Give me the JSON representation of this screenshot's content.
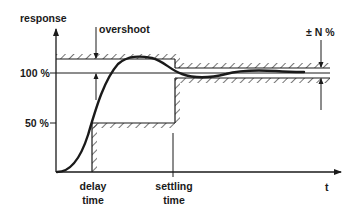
{
  "diagram": {
    "axes": {
      "y_label": "response",
      "x_label": "t"
    },
    "levels": {
      "full": "100 %",
      "half": "50 %"
    },
    "annotations": {
      "overshoot": "overshoot",
      "tolerance": "± N %",
      "delay_time_line1": "delay",
      "delay_time_line2": "time",
      "settling_time_line1": "settling",
      "settling_time_line2": "time"
    },
    "colors": {
      "ink": "#1a1a1a",
      "background": "#ffffff"
    }
  }
}
